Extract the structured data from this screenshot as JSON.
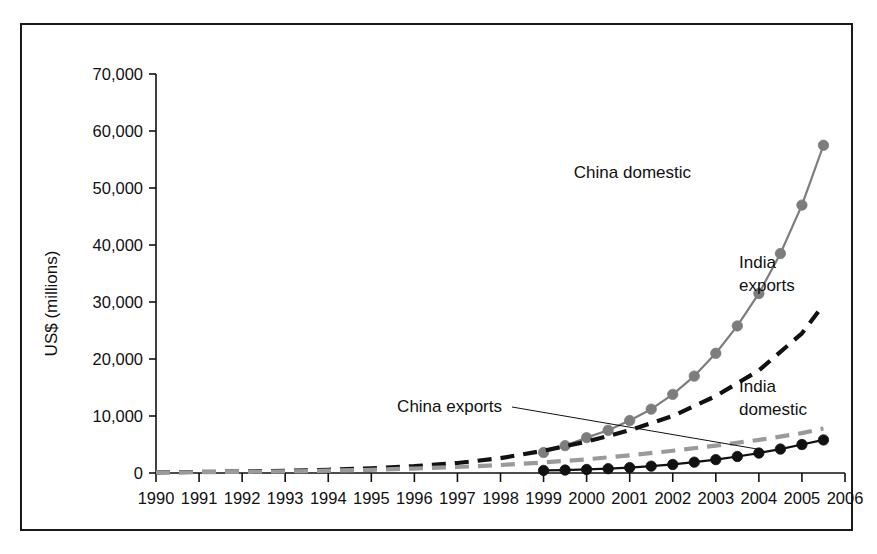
{
  "chart_data": {
    "type": "line",
    "title": "",
    "subtitle": "",
    "xlabel": "",
    "ylabel": "US$ (millions)",
    "xlim": [
      1990,
      2006
    ],
    "ylim": [
      0,
      70000
    ],
    "grid": false,
    "legend_position": "inline-annotations",
    "xticklabels": [
      "1990",
      "1991",
      "1992",
      "1993",
      "1994",
      "1995",
      "1996",
      "1997",
      "1998",
      "1999",
      "2000",
      "2001",
      "2002",
      "2003",
      "2004",
      "2005",
      "2006"
    ],
    "yticklabels": [
      "0",
      "10,000",
      "20,000",
      "30,000",
      "40,000",
      "50,000",
      "60,000",
      "70,000"
    ],
    "ytickvalues": [
      0,
      10000,
      20000,
      30000,
      40000,
      50000,
      60000,
      70000
    ],
    "series": [
      {
        "name": "China domestic",
        "style": "solid-line-with-circle-markers",
        "color": "#7d7d7d",
        "marker": "circle",
        "x": [
          1999.0,
          1999.5,
          2000.0,
          2000.5,
          2001.0,
          2001.5,
          2002.0,
          2002.5,
          2003.0,
          2003.5,
          2004.0,
          2004.5,
          2005.0,
          2005.5
        ],
        "values": [
          3600,
          4800,
          6200,
          7500,
          9200,
          11200,
          13800,
          17000,
          21000,
          25800,
          31500,
          38500,
          47000,
          57500
        ]
      },
      {
        "name": "India exports",
        "style": "dashed-line",
        "color": "#111111",
        "marker": "none",
        "x": [
          1990,
          1991,
          1992,
          1993,
          1994,
          1995,
          1996,
          1997,
          1998,
          1999,
          2000,
          2001,
          2002,
          2003,
          2004,
          2005,
          2005.5
        ],
        "values": [
          120,
          180,
          260,
          380,
          560,
          820,
          1200,
          1750,
          2600,
          3900,
          5500,
          7500,
          10000,
          13500,
          18000,
          24500,
          29500
        ]
      },
      {
        "name": "India domestic",
        "style": "dashed-line",
        "color": "#9a9a9a",
        "marker": "none",
        "x": [
          1990,
          1991,
          1992,
          1993,
          1994,
          1995,
          1996,
          1997,
          1998,
          1999,
          2000,
          2001,
          2002,
          2003,
          2004,
          2005,
          2005.5
        ],
        "values": [
          100,
          140,
          200,
          280,
          400,
          560,
          780,
          1050,
          1400,
          1850,
          2400,
          3100,
          3900,
          4800,
          5800,
          7000,
          7800
        ]
      },
      {
        "name": "China exports",
        "style": "solid-line-with-filled-circle-markers",
        "color": "#111111",
        "marker": "filled-circle",
        "x": [
          1999.0,
          1999.5,
          2000.0,
          2000.5,
          2001.0,
          2001.5,
          2002.0,
          2002.5,
          2003.0,
          2003.5,
          2004.0,
          2004.5,
          2005.0,
          2005.5
        ],
        "values": [
          450,
          520,
          620,
          760,
          950,
          1200,
          1500,
          1900,
          2350,
          2900,
          3500,
          4200,
          5000,
          5800
        ]
      }
    ],
    "annotations": [
      {
        "name": "china-domestic",
        "text": "China domestic",
        "lines": [
          "China domestic"
        ],
        "x": 691,
        "y": 178,
        "anchor": "end",
        "leader": false
      },
      {
        "name": "india-exports",
        "text": "India exports",
        "lines": [
          "India",
          "exports"
        ],
        "x": 739,
        "y": 268,
        "anchor": "start",
        "leader": false
      },
      {
        "name": "india-domestic",
        "text": "India domestic",
        "lines": [
          "India",
          "domestic"
        ],
        "x": 739,
        "y": 392,
        "anchor": "start",
        "leader": false
      },
      {
        "name": "china-exports",
        "text": "China exports",
        "lines": [
          "China exports"
        ],
        "x": 502,
        "y": 412,
        "anchor": "end",
        "leader": true
      }
    ]
  },
  "colors": {
    "frame_border": "#1a1a1a",
    "axis": "#111111",
    "china_domestic": "#7d7d7d",
    "india_exports": "#111111",
    "india_domestic": "#9a9a9a",
    "china_exports": "#111111",
    "background": "#ffffff"
  }
}
